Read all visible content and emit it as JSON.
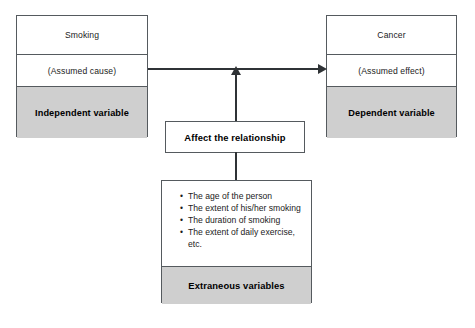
{
  "diagram": {
    "colors": {
      "gray_band": "#cfcfcf",
      "border": "#555a5e",
      "connector": "#2f3336",
      "background": "#ffffff",
      "text": "#1b1b1b"
    },
    "cause_box": {
      "variable_name": "Smoking",
      "role_note": "(Assumed cause)",
      "variable_type": "Independent variable"
    },
    "effect_box": {
      "variable_name": "Cancer",
      "role_note": "(Assumed effect)",
      "variable_type": "Dependent variable"
    },
    "moderator_box": {
      "label": "Affect the relationship"
    },
    "extraneous_box": {
      "items": [
        "The age of the person",
        "The extent of his/her smoking",
        "The duration of smoking",
        "The extent of daily exercise, etc."
      ],
      "variable_type": "Extraneous variables"
    },
    "connectors": {
      "cause_to_effect": "arrow-right",
      "moderator_to_relationship": "arrow-up",
      "extraneous_to_moderator": "line"
    }
  }
}
